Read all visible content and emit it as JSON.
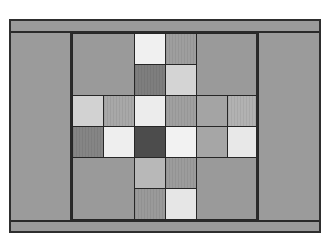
{
  "diagram": {
    "type": "quilt-block",
    "frame_color": "#9b9b9b",
    "line_color": "#262626",
    "grid": {
      "rows": 6,
      "cols": 6,
      "cell_px": 31
    },
    "cells": [
      {
        "r": 0,
        "c": 0,
        "rs": 2,
        "cs": 2,
        "color": "#9a9a9a",
        "striped": false
      },
      {
        "r": 0,
        "c": 2,
        "rs": 1,
        "cs": 1,
        "color": "#f0f0f0",
        "striped": false
      },
      {
        "r": 0,
        "c": 3,
        "rs": 1,
        "cs": 1,
        "color": "#9e9e9e",
        "striped": true
      },
      {
        "r": 0,
        "c": 4,
        "rs": 2,
        "cs": 2,
        "color": "#9a9a9a",
        "striped": false
      },
      {
        "r": 1,
        "c": 2,
        "rs": 1,
        "cs": 1,
        "color": "#7e7e7e",
        "striped": true
      },
      {
        "r": 1,
        "c": 3,
        "rs": 1,
        "cs": 1,
        "color": "#d4d4d4",
        "striped": false
      },
      {
        "r": 2,
        "c": 0,
        "rs": 1,
        "cs": 1,
        "color": "#d2d2d2",
        "striped": false
      },
      {
        "r": 2,
        "c": 1,
        "rs": 1,
        "cs": 1,
        "color": "#a8a8a8",
        "striped": true
      },
      {
        "r": 2,
        "c": 2,
        "rs": 1,
        "cs": 1,
        "color": "#ececec",
        "striped": false
      },
      {
        "r": 2,
        "c": 3,
        "rs": 1,
        "cs": 1,
        "color": "#a0a0a0",
        "striped": true
      },
      {
        "r": 2,
        "c": 4,
        "rs": 1,
        "cs": 1,
        "color": "#a4a4a4",
        "striped": false
      },
      {
        "r": 2,
        "c": 5,
        "rs": 1,
        "cs": 1,
        "color": "#b2b2b2",
        "striped": true
      },
      {
        "r": 3,
        "c": 0,
        "rs": 1,
        "cs": 1,
        "color": "#858585",
        "striped": true
      },
      {
        "r": 3,
        "c": 1,
        "rs": 1,
        "cs": 1,
        "color": "#eeeeee",
        "striped": false
      },
      {
        "r": 3,
        "c": 2,
        "rs": 1,
        "cs": 1,
        "color": "#4c4c4c",
        "striped": false
      },
      {
        "r": 3,
        "c": 3,
        "rs": 1,
        "cs": 1,
        "color": "#f2f2f2",
        "striped": false
      },
      {
        "r": 3,
        "c": 4,
        "rs": 1,
        "cs": 1,
        "color": "#a6a6a6",
        "striped": false
      },
      {
        "r": 3,
        "c": 5,
        "rs": 1,
        "cs": 1,
        "color": "#e8e8e8",
        "striped": false
      },
      {
        "r": 4,
        "c": 0,
        "rs": 2,
        "cs": 2,
        "color": "#9a9a9a",
        "striped": false
      },
      {
        "r": 4,
        "c": 2,
        "rs": 1,
        "cs": 1,
        "color": "#b8b8b8",
        "striped": false
      },
      {
        "r": 4,
        "c": 3,
        "rs": 1,
        "cs": 1,
        "color": "#9c9c9c",
        "striped": true
      },
      {
        "r": 4,
        "c": 4,
        "rs": 2,
        "cs": 2,
        "color": "#9a9a9a",
        "striped": false
      },
      {
        "r": 5,
        "c": 2,
        "rs": 1,
        "cs": 1,
        "color": "#9a9a9a",
        "striped": true
      },
      {
        "r": 5,
        "c": 3,
        "rs": 1,
        "cs": 1,
        "color": "#e6e6e6",
        "striped": false
      }
    ]
  }
}
